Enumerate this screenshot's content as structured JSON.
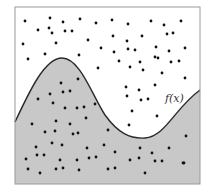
{
  "figure": {
    "curve_label": "f(x)",
    "colors": {
      "background": "#ffffff",
      "shaded_region": "#c8c8c8",
      "frame": "#9a9a9a",
      "curve": "#2a2a2a",
      "points": "#111111"
    },
    "frame": {
      "x": 15,
      "y": 7,
      "width": 185,
      "height": 177
    },
    "curve_path": "M15,122 C30,90 45,58 62,58 C80,58 92,95 105,115 C118,133 130,139 145,138 C165,137 175,108 200,90 L200,184 L15,184 Z",
    "curve_line": "M15,122 C30,90 45,58 62,58 C80,58 92,95 105,115 C118,133 130,139 145,138 C165,137 175,108 200,90",
    "label_position": {
      "x": 165,
      "y": 102
    },
    "points": [
      [
        25,
        21
      ],
      [
        50,
        18
      ],
      [
        63,
        22
      ],
      [
        80,
        19
      ],
      [
        96,
        23
      ],
      [
        112,
        20
      ],
      [
        128,
        24
      ],
      [
        151,
        21
      ],
      [
        164,
        25
      ],
      [
        181,
        21
      ],
      [
        38,
        30
      ],
      [
        49,
        28
      ],
      [
        52,
        33
      ],
      [
        65,
        31
      ],
      [
        72,
        31
      ],
      [
        142,
        36
      ],
      [
        167,
        34
      ],
      [
        173,
        33
      ],
      [
        23,
        44
      ],
      [
        56,
        43
      ],
      [
        88,
        40
      ],
      [
        113,
        36
      ],
      [
        127,
        41
      ],
      [
        156,
        47
      ],
      [
        185,
        48
      ],
      [
        28,
        59
      ],
      [
        45,
        54
      ],
      [
        79,
        55
      ],
      [
        101,
        48
      ],
      [
        114,
        52
      ],
      [
        128,
        49
      ],
      [
        135,
        50
      ],
      [
        155,
        57
      ],
      [
        169,
        51
      ],
      [
        119,
        61
      ],
      [
        140,
        62
      ],
      [
        158,
        58
      ],
      [
        171,
        62
      ],
      [
        179,
        61
      ],
      [
        98,
        68
      ],
      [
        130,
        67
      ],
      [
        143,
        70
      ],
      [
        162,
        73
      ],
      [
        185,
        78
      ],
      [
        126,
        87
      ],
      [
        139,
        90
      ],
      [
        155,
        85
      ],
      [
        127,
        96
      ],
      [
        141,
        100
      ],
      [
        148,
        99
      ],
      [
        132,
        111
      ],
      [
        157,
        116
      ],
      [
        129,
        125
      ],
      [
        61,
        83
      ],
      [
        78,
        79
      ],
      [
        50,
        94
      ],
      [
        63,
        92
      ],
      [
        70,
        91
      ],
      [
        38,
        99
      ],
      [
        53,
        103
      ],
      [
        65,
        108
      ],
      [
        77,
        108
      ],
      [
        84,
        107
      ],
      [
        95,
        104
      ],
      [
        32,
        124
      ],
      [
        56,
        121
      ],
      [
        70,
        124
      ],
      [
        86,
        118
      ],
      [
        45,
        132
      ],
      [
        55,
        131
      ],
      [
        73,
        134
      ],
      [
        78,
        133
      ],
      [
        108,
        130
      ],
      [
        52,
        143
      ],
      [
        62,
        145
      ],
      [
        36,
        147
      ],
      [
        104,
        145
      ],
      [
        87,
        148
      ],
      [
        140,
        148
      ],
      [
        169,
        148
      ],
      [
        186,
        136
      ],
      [
        26,
        159
      ],
      [
        37,
        155
      ],
      [
        44,
        155
      ],
      [
        60,
        160
      ],
      [
        77,
        160
      ],
      [
        89,
        158
      ],
      [
        96,
        157
      ],
      [
        115,
        152
      ],
      [
        130,
        160
      ],
      [
        139,
        158
      ],
      [
        152,
        153
      ],
      [
        155,
        161
      ],
      [
        162,
        161
      ],
      [
        183,
        163
      ],
      [
        28,
        169
      ],
      [
        40,
        173
      ],
      [
        56,
        169
      ],
      [
        63,
        168
      ],
      [
        79,
        170
      ],
      [
        108,
        169
      ],
      [
        115,
        168
      ],
      [
        145,
        173
      ],
      [
        184,
        163
      ]
    ]
  }
}
